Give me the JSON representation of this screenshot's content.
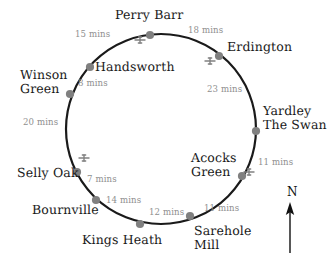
{
  "diagram": {
    "type": "circular-route-map",
    "title_visible": false,
    "circle": {
      "cx": 161,
      "cy": 129,
      "r": 95,
      "stroke": "#1a1a1a",
      "stroke_width": 2.2
    },
    "colors": {
      "route_line": "#1a1a1a",
      "station_dot": "#808080",
      "station_text": "#1a1a1a",
      "time_text": "#8f8f8f",
      "rail_icon": "#808080",
      "background": "#ffffff"
    }
  },
  "stations": [
    {
      "name": "Perry Barr",
      "label": "Perry Barr",
      "label2": "",
      "dot": {
        "x": 150,
        "y": 35
      },
      "label_x": 115,
      "label_y": 8,
      "align": "left",
      "rail_icon": true,
      "rail_x": 140,
      "rail_y": 40
    },
    {
      "name": "Erdington",
      "label": "Erdington",
      "label2": "",
      "dot": {
        "x": 219,
        "y": 56
      },
      "label_x": 227,
      "label_y": 40,
      "align": "left",
      "rail_icon": true,
      "rail_x": 210,
      "rail_y": 61
    },
    {
      "name": "Yardley The Swan",
      "label": "Yardley",
      "label2": "The Swan",
      "dot": {
        "x": 256,
        "y": 131
      },
      "label_x": 263,
      "label_y": 104,
      "align": "left",
      "rail_icon": false,
      "rail_x": 0,
      "rail_y": 0
    },
    {
      "name": "Acocks Green",
      "label": "Acocks",
      "label2": "Green",
      "dot": {
        "x": 242,
        "y": 176
      },
      "label_x": 191,
      "label_y": 151,
      "align": "left",
      "rail_icon": true,
      "rail_x": 249,
      "rail_y": 172
    },
    {
      "name": "Sarehole Mill",
      "label": "Sarehole",
      "label2": "Mill",
      "dot": {
        "x": 190,
        "y": 216
      },
      "label_x": 194,
      "label_y": 224,
      "align": "left",
      "rail_icon": false,
      "rail_x": 0,
      "rail_y": 0
    },
    {
      "name": "Kings Heath",
      "label": "Kings Heath",
      "label2": "",
      "dot": {
        "x": 140,
        "y": 224
      },
      "label_x": 82,
      "label_y": 233,
      "align": "left",
      "rail_icon": false,
      "rail_x": 0,
      "rail_y": 0
    },
    {
      "name": "Bournville",
      "label": "Bournville",
      "label2": "",
      "dot": {
        "x": 96,
        "y": 200
      },
      "label_x": 32,
      "label_y": 203,
      "align": "left",
      "rail_icon": false,
      "rail_x": 0,
      "rail_y": 0
    },
    {
      "name": "Selly Oak",
      "label": "Selly Oak",
      "label2": "",
      "dot": {
        "x": 77,
        "y": 172
      },
      "label_x": 17,
      "label_y": 166,
      "align": "left",
      "rail_icon": true,
      "rail_x": 84,
      "rail_y": 158
    },
    {
      "name": "Winson Green",
      "label": "Winson",
      "label2": "Green",
      "dot": {
        "x": 70,
        "y": 94
      },
      "label_x": 20,
      "label_y": 68,
      "align": "left",
      "rail_icon": false,
      "rail_x": 0,
      "rail_y": 0
    },
    {
      "name": "Handsworth",
      "label": "Handsworth",
      "label2": "",
      "dot": {
        "x": 90,
        "y": 67
      },
      "label_x": 95,
      "label_y": 60,
      "align": "left",
      "rail_icon": false,
      "rail_x": 0,
      "rail_y": 0
    }
  ],
  "segments": [
    {
      "from": "Handsworth",
      "to": "Perry Barr",
      "time": "15 mins",
      "x": 75,
      "y": 30
    },
    {
      "from": "Perry Barr",
      "to": "Erdington",
      "time": "18 mins",
      "x": 188,
      "y": 26
    },
    {
      "from": "Erdington",
      "to": "Yardley The Swan",
      "time": "23 mins",
      "x": 207,
      "y": 85
    },
    {
      "from": "Yardley The Swan",
      "to": "Acocks Green",
      "time": "11 mins",
      "x": 258,
      "y": 158
    },
    {
      "from": "Acocks Green",
      "to": "Sarehole Mill",
      "time": "11 mins",
      "x": 204,
      "y": 204
    },
    {
      "from": "Sarehole Mill",
      "to": "Kings Heath",
      "time": "12 mins",
      "x": 149,
      "y": 208
    },
    {
      "from": "Kings Heath",
      "to": "Bournville",
      "time": "14 mins",
      "x": 106,
      "y": 196
    },
    {
      "from": "Bournville",
      "to": "Selly Oak",
      "time": "7 mins",
      "x": 87,
      "y": 175
    },
    {
      "from": "Selly Oak",
      "to": "Winson Green",
      "time": "20 mins",
      "x": 23,
      "y": 118
    },
    {
      "from": "Winson Green",
      "to": "Handsworth",
      "time": "8 mins",
      "x": 78,
      "y": 79
    }
  ],
  "compass": {
    "label": "N",
    "label_x": 287,
    "label_y": 186,
    "arrow_x": 290,
    "arrow_top": 202,
    "arrow_bottom": 253
  }
}
